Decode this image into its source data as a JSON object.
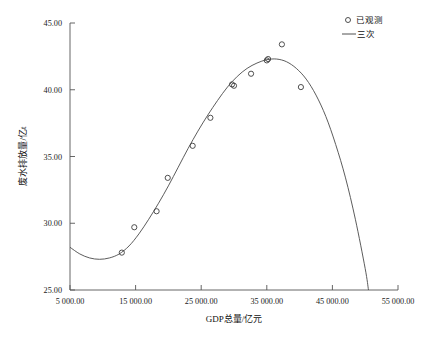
{
  "chart_data": {
    "type": "scatter",
    "title": "",
    "xlabel": "GDP总量/亿元",
    "ylabel": "废水排放量/亿t",
    "xlim": [
      5000,
      55000
    ],
    "ylim": [
      25.0,
      45.0
    ],
    "grid": false,
    "legend_position": "top-right",
    "xticks": [
      5000,
      15000,
      25000,
      35000,
      45000,
      55000
    ],
    "xtick_labels": [
      "5 000.00",
      "15 000.00",
      "25 000.00",
      "35 000.00",
      "45 000.00",
      "55 000.00"
    ],
    "yticks": [
      25.0,
      30.0,
      35.0,
      40.0,
      45.0
    ],
    "ytick_labels": [
      "25.00",
      "30.00",
      "35.00",
      "40.00",
      "45.00"
    ],
    "series": [
      {
        "name": "已观测",
        "marker": "open-circle",
        "type": "scatter",
        "points": [
          {
            "x": 12900,
            "y": 27.8
          },
          {
            "x": 14800,
            "y": 29.7
          },
          {
            "x": 18200,
            "y": 30.9
          },
          {
            "x": 19900,
            "y": 33.4
          },
          {
            "x": 23700,
            "y": 35.8
          },
          {
            "x": 26400,
            "y": 37.9
          },
          {
            "x": 29700,
            "y": 40.4
          },
          {
            "x": 30000,
            "y": 40.3
          },
          {
            "x": 32600,
            "y": 41.2
          },
          {
            "x": 35000,
            "y": 42.2
          },
          {
            "x": 35200,
            "y": 42.3
          },
          {
            "x": 37300,
            "y": 43.4
          },
          {
            "x": 40200,
            "y": 40.2
          }
        ]
      },
      {
        "name": "三次",
        "marker": "line",
        "type": "line",
        "description": "cubic fit curve",
        "points": [
          {
            "x": 5000,
            "y": 28.2
          },
          {
            "x": 6500,
            "y": 27.7
          },
          {
            "x": 8000,
            "y": 27.4
          },
          {
            "x": 9500,
            "y": 27.3
          },
          {
            "x": 11000,
            "y": 27.4
          },
          {
            "x": 12500,
            "y": 27.7
          },
          {
            "x": 14000,
            "y": 28.3
          },
          {
            "x": 15500,
            "y": 29.2
          },
          {
            "x": 17000,
            "y": 30.3
          },
          {
            "x": 18500,
            "y": 31.5
          },
          {
            "x": 20000,
            "y": 32.8
          },
          {
            "x": 21500,
            "y": 34.2
          },
          {
            "x": 23000,
            "y": 35.6
          },
          {
            "x": 24500,
            "y": 36.9
          },
          {
            "x": 26000,
            "y": 38.1
          },
          {
            "x": 27500,
            "y": 39.2
          },
          {
            "x": 29000,
            "y": 40.2
          },
          {
            "x": 30500,
            "y": 41.0
          },
          {
            "x": 32000,
            "y": 41.6
          },
          {
            "x": 33500,
            "y": 42.0
          },
          {
            "x": 35000,
            "y": 42.25
          },
          {
            "x": 36500,
            "y": 42.3
          },
          {
            "x": 38000,
            "y": 42.1
          },
          {
            "x": 39500,
            "y": 41.6
          },
          {
            "x": 41000,
            "y": 40.8
          },
          {
            "x": 42500,
            "y": 39.6
          },
          {
            "x": 44000,
            "y": 38.0
          },
          {
            "x": 45500,
            "y": 35.9
          },
          {
            "x": 47000,
            "y": 33.4
          },
          {
            "x": 48500,
            "y": 30.3
          },
          {
            "x": 50000,
            "y": 26.6
          },
          {
            "x": 50500,
            "y": 25.0
          }
        ]
      }
    ]
  },
  "legend": {
    "items": [
      {
        "label": "已观测",
        "symbol": "circle"
      },
      {
        "label": "三次",
        "symbol": "line"
      }
    ]
  },
  "axes": {
    "x_title": "GDP总量/亿元",
    "y_title": "废水排放量/亿t"
  }
}
